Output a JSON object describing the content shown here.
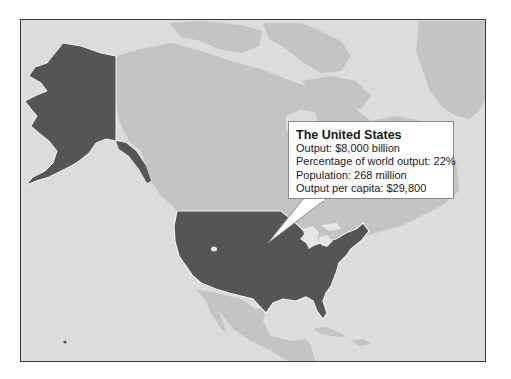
{
  "map": {
    "region": "North America",
    "highlighted_country": "The United States",
    "colors": {
      "ocean": "#dcdcdc",
      "land_other": "#c4c4c4",
      "land_highlight": "#555555",
      "lakes": "#e6e6e6",
      "frame": "#3a3a3a",
      "callout_bg": "#ffffff"
    }
  },
  "callout": {
    "title": "The United States",
    "lines": [
      "Output: $8,000 billion",
      "Percentage of world output: 22%",
      "Population: 268 million",
      "Output per capita: $29,800"
    ]
  },
  "stats": {
    "output": "$8,000 billion",
    "share_of_world_output": "22%",
    "population": "268 million",
    "output_per_capita": "$29,800"
  }
}
